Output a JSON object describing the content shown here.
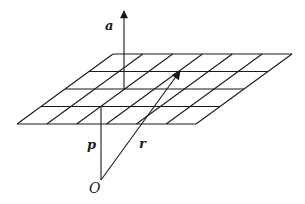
{
  "diagram": {
    "stroke_color": "#1a1a1a",
    "background": "#ffffff",
    "plane": {
      "rows": 4,
      "cols": 6,
      "corners": {
        "top_left": [
          113,
          54
        ],
        "top_right": [
          292,
          54
        ],
        "bottom_right": [
          196,
          124
        ],
        "bottom_left": [
          17,
          124
        ]
      }
    },
    "vectors": {
      "a": {
        "label": "a",
        "from": [
          124,
          89
        ],
        "to": [
          124,
          11
        ],
        "style": "bold-italic"
      },
      "p": {
        "label": "p",
        "from": [
          101,
          180
        ],
        "to": [
          101,
          107
        ],
        "style": "bold-italic"
      },
      "r": {
        "label": "r",
        "from": [
          101,
          180
        ],
        "to": [
          180,
          71
        ],
        "style": "bold-italic"
      }
    },
    "origin": {
      "label": "O",
      "position": [
        101,
        180
      ]
    }
  }
}
